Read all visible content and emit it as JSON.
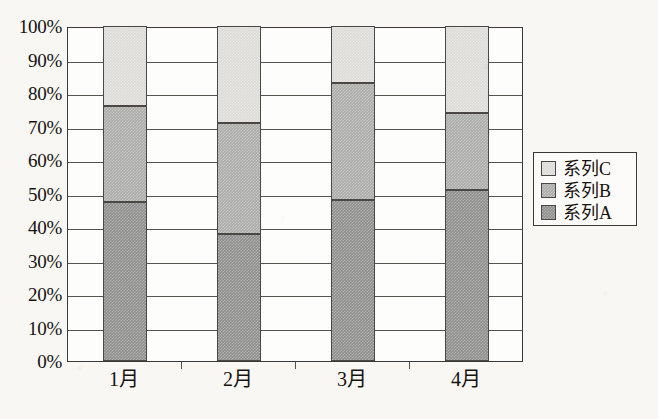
{
  "chart_data": {
    "type": "bar",
    "subtype": "stacked-percentage-column",
    "title": "",
    "subtitle": "",
    "xlabel": "",
    "ylabel": "",
    "categories": [
      "1月",
      "2月",
      "3月",
      "4月"
    ],
    "series": [
      {
        "name": "系列A",
        "values": [
          47.5,
          38.0,
          48.0,
          51.0
        ],
        "color": "#8d8d8b"
      },
      {
        "name": "系列B",
        "values": [
          28.5,
          33.0,
          35.0,
          23.0
        ],
        "color": "#ababa8"
      },
      {
        "name": "系列C",
        "values": [
          24.0,
          29.0,
          17.0,
          26.0
        ],
        "color": "#dcdbd7"
      }
    ],
    "cumulative_tops": {
      "系列A": [
        47.5,
        38.0,
        48.0,
        51.0
      ],
      "系列B": [
        76.0,
        71.0,
        83.0,
        74.0
      ],
      "系列C": [
        100,
        100,
        100,
        100
      ]
    },
    "ylim": [
      0,
      100
    ],
    "y_tick_labels": [
      "100%",
      "90%",
      "80%",
      "70%",
      "60%",
      "50%",
      "40%",
      "30%",
      "20%",
      "10%",
      "0%"
    ],
    "y_tick_values": [
      100,
      90,
      80,
      70,
      60,
      50,
      40,
      30,
      20,
      10,
      0
    ],
    "grid": "horizontal",
    "legend_position": "right",
    "legend_order": [
      "系列C",
      "系列B",
      "系列A"
    ]
  },
  "legend": {
    "items": [
      {
        "label": "系列C",
        "color": "#dcdbd7",
        "swatch_name": "legend-swatch-series-c"
      },
      {
        "label": "系列B",
        "color": "#ababa8",
        "swatch_name": "legend-swatch-series-b"
      },
      {
        "label": "系列A",
        "color": "#8d8d8b",
        "swatch_name": "legend-swatch-series-a"
      }
    ]
  },
  "axis": {
    "y_labels": [
      "100%",
      "90%",
      "80%",
      "70%",
      "60%",
      "50%",
      "40%",
      "30%",
      "20%",
      "10%",
      "0%"
    ],
    "x_labels": [
      "1月",
      "2月",
      "3月",
      "4月"
    ]
  },
  "colors": {
    "series_a": "#8d8d8b",
    "series_b": "#ababa8",
    "series_c": "#dcdbd7",
    "axis_line": "#3a3a38",
    "gridline": "#56544f",
    "text": "#16120f",
    "paper": "#f8f7f4",
    "plot_background": "#fdfdfb"
  }
}
